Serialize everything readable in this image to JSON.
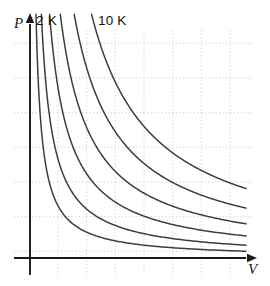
{
  "figure": {
    "name": "pressure-volume-isotherms",
    "background_color": "#ffffff"
  },
  "axes": {
    "x": {
      "label": "V",
      "name": "volume-axis",
      "color": "#1a1a1a",
      "arrow": true,
      "y_px": 258,
      "x_start_px": 14,
      "x_end_px": 252
    },
    "y": {
      "label": "P",
      "name": "pressure-axis",
      "color": "#1a1a1a",
      "arrow": true,
      "x_px": 30,
      "y_start_px": 275,
      "y_end_px": 18
    }
  },
  "grid": {
    "color": "#b9b9b9",
    "dash": "1,2.6",
    "width": 0.8,
    "vertical_px": [
      58,
      86.7,
      115.3,
      144,
      172.7,
      201.3,
      230
    ],
    "horizontal_px": [
      43.3,
      78,
      112.7,
      147.3,
      182,
      216.7,
      251.3
    ]
  },
  "labels": {
    "coldest": "2 K",
    "hottest": "10 K",
    "pressure_axis": "P",
    "volume_axis": "V"
  },
  "chart_data": {
    "type": "line",
    "title": "",
    "xlabel": "V",
    "ylabel": "P",
    "grid": true,
    "legend": "none",
    "annotations": [
      {
        "text": "2 K",
        "note": "labels the leftmost (lowest temperature) isotherm"
      },
      {
        "text": "10 K",
        "note": "labels the rightmost (highest temperature) isotherm"
      }
    ],
    "relation": "P = k*T / V",
    "xlim": [
      0,
      8
    ],
    "ylim": [
      0,
      8
    ],
    "series": [
      {
        "name": "2 K",
        "temperature_K": 2,
        "k": 1.9,
        "color": "#3d3d3d"
      },
      {
        "name": "4 K",
        "temperature_K": 4,
        "k": 3.6,
        "color": "#3d3d3d"
      },
      {
        "name": "5.6 K",
        "temperature_K": 5.6,
        "k": 6.2,
        "color": "#3d3d3d"
      },
      {
        "name": "7.2 K",
        "temperature_K": 7.2,
        "k": 9.6,
        "color": "#3d3d3d"
      },
      {
        "name": "8.6 K",
        "temperature_K": 8.6,
        "k": 14.0,
        "color": "#3d3d3d"
      },
      {
        "name": "10 K",
        "temperature_K": 10,
        "k": 19.5,
        "color": "#3d3d3d"
      }
    ]
  },
  "curves": {
    "stroke_color": "#3d3d3d",
    "stroke_width": 1.5,
    "count": 6
  }
}
